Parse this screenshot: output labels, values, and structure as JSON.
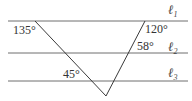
{
  "diagram": {
    "lines": [
      {
        "name": "ℓ",
        "subscript": "1"
      },
      {
        "name": "ℓ",
        "subscript": "2"
      },
      {
        "name": "ℓ",
        "subscript": "3"
      }
    ],
    "angles": {
      "left_top": "135°",
      "right_top": "120°",
      "right_middle": "58°",
      "bottom_left": "45°"
    }
  }
}
